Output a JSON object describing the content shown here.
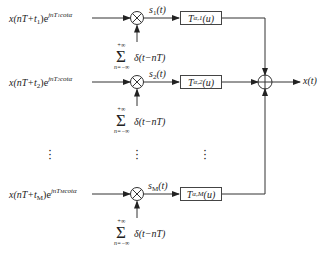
{
  "diagram": {
    "type": "block-diagram",
    "branches": [
      {
        "input": {
          "base": "x(nT+t",
          "sub": "1",
          "close": ")e",
          "exp": "jnT",
          "exp_sub": "1",
          "exp_tail": "cotα"
        },
        "product_label": {
          "main": "s",
          "sub": "1",
          "arg": "(t)"
        },
        "filter": {
          "main": "T",
          "sub": "α,1",
          "arg": "(u)"
        },
        "impulse": {
          "sigma": "Σ",
          "upper": "+∞",
          "lower": "n=−∞",
          "term": "δ(t−nT)"
        }
      },
      {
        "input": {
          "base": "x(nT+t",
          "sub": "2",
          "close": ")e",
          "exp": "jnT",
          "exp_sub": "2",
          "exp_tail": "cotα"
        },
        "product_label": {
          "main": "s",
          "sub": "2",
          "arg": "(t)"
        },
        "filter": {
          "main": "T",
          "sub": "α,2",
          "arg": "(u)"
        },
        "impulse": {
          "sigma": "Σ",
          "upper": "+∞",
          "lower": "n=−∞",
          "term": "δ(t−nT)"
        }
      },
      {
        "input": {
          "base": "x(nT+t",
          "sub": "M",
          "close": ")e",
          "exp": "jnT",
          "exp_sub": "M",
          "exp_tail": "cotα"
        },
        "product_label": {
          "main": "s",
          "sub": "M",
          "arg": "(t)"
        },
        "filter": {
          "main": "T",
          "sub": "α,M",
          "arg": "(u)"
        },
        "impulse": {
          "sigma": "Σ",
          "upper": "+∞",
          "lower": "n=−∞",
          "term": "δ(t−nT)"
        }
      }
    ],
    "ellipsis": "⋮",
    "multiplier_symbol": "⊗",
    "adder_symbol": "⊕",
    "output": "x(t)"
  }
}
